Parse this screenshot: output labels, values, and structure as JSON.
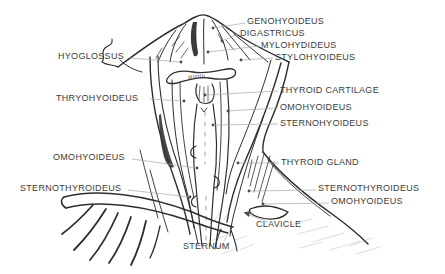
{
  "colors": {
    "background": "#ffffff",
    "ink": "#2e2e2e",
    "label_text": "#3b3b3b",
    "leader_line": "#a8a8a8"
  },
  "labels": {
    "genohyoideus": "GENOHYOIDEUS",
    "digastricus": "DIGASTRICUS",
    "mylohydideus": "MYLOHYDIDEUS",
    "stylohyoideus": "STYLOHYOIDEUS",
    "hyoglossus": "HYOGLOSSUS",
    "thryohyoideus": "THRYOHYOIDEUS",
    "thyroid_cartilage": "THYROID CARTILAGE",
    "omohyoideus_upper_right": "OMOHYOIDEUS",
    "sternohyoideus": "STERNOHYOIDEUS",
    "omohyoideus_left": "OMOHYOIDEUS",
    "thyroid_gland": "THYROID GLAND",
    "sternothyroideus_left": "STERNOTHYROIDEUS",
    "sternothyroideus_right": "STERNOTHYROIDEUS",
    "omohyoideus_lower_right": "OMOHYOIDEUS",
    "clavicle": "CLAVICLE",
    "sternum": "STERNUM",
    "hyoid_bone": "HYOID"
  }
}
